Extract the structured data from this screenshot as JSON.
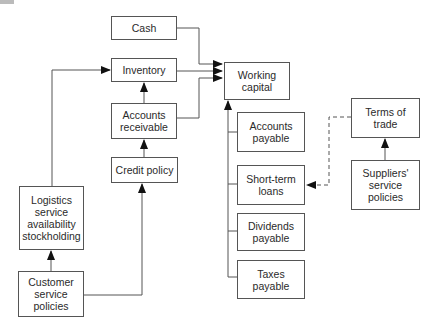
{
  "diagram": {
    "type": "flow",
    "nodes": [
      {
        "id": "cash",
        "label": "Cash",
        "x": 111,
        "y": 16,
        "w": 66,
        "h": 24
      },
      {
        "id": "inventory",
        "label": "Inventory",
        "x": 111,
        "y": 58,
        "w": 66,
        "h": 24
      },
      {
        "id": "accounts_receivable",
        "label": "Accounts\nreceivable",
        "x": 111,
        "y": 103,
        "w": 66,
        "h": 36
      },
      {
        "id": "credit_policy",
        "label": "Credit policy",
        "x": 111,
        "y": 157,
        "w": 67,
        "h": 26
      },
      {
        "id": "working_capital",
        "label": "Working\ncapital",
        "x": 224,
        "y": 62,
        "w": 66,
        "h": 38
      },
      {
        "id": "accounts_payable",
        "label": "Accounts\npayable",
        "x": 237,
        "y": 112,
        "w": 68,
        "h": 40
      },
      {
        "id": "short_term_loans",
        "label": "Short-term\nloans",
        "x": 237,
        "y": 165,
        "w": 68,
        "h": 40
      },
      {
        "id": "dividends_payable",
        "label": "Dividends\npayable",
        "x": 237,
        "y": 213,
        "w": 68,
        "h": 38
      },
      {
        "id": "taxes_payable",
        "label": "Taxes\npayable",
        "x": 237,
        "y": 260,
        "w": 68,
        "h": 39
      },
      {
        "id": "terms_of_trade",
        "label": "Terms of\ntrade",
        "x": 351,
        "y": 98,
        "w": 69,
        "h": 40
      },
      {
        "id": "suppliers_service_policies",
        "label": "Suppliers'\nservice\npolicies",
        "x": 351,
        "y": 160,
        "w": 69,
        "h": 50
      },
      {
        "id": "logistics_service",
        "label": "Logistics\nservice\navailability\nstockholding",
        "x": 19,
        "y": 186,
        "w": 65,
        "h": 64
      },
      {
        "id": "customer_service_policies",
        "label": "Customer\nservice\npolicies",
        "x": 18,
        "y": 271,
        "w": 66,
        "h": 46
      }
    ],
    "edges": [
      {
        "from": "cash",
        "to": "working_capital",
        "style": "solid"
      },
      {
        "from": "inventory",
        "to": "working_capital",
        "style": "solid"
      },
      {
        "from": "accounts_receivable",
        "to": "working_capital",
        "style": "solid"
      },
      {
        "from": "accounts_receivable",
        "to": "inventory",
        "style": "solid"
      },
      {
        "from": "credit_policy",
        "to": "accounts_receivable",
        "style": "solid"
      },
      {
        "from": "logistics_service",
        "to": "inventory",
        "style": "solid"
      },
      {
        "from": "customer_service_policies",
        "to": "logistics_service",
        "style": "solid"
      },
      {
        "from": "customer_service_policies",
        "to": "credit_policy",
        "style": "solid"
      },
      {
        "from": "accounts_payable",
        "to": "working_capital",
        "style": "solid"
      },
      {
        "from": "short_term_loans",
        "to": "working_capital",
        "style": "solid"
      },
      {
        "from": "dividends_payable",
        "to": "working_capital",
        "style": "solid"
      },
      {
        "from": "taxes_payable",
        "to": "working_capital",
        "style": "solid"
      },
      {
        "from": "terms_of_trade",
        "to": "short_term_loans",
        "style": "dashed"
      },
      {
        "from": "suppliers_service_policies",
        "to": "terms_of_trade",
        "style": "solid"
      }
    ],
    "colors": {
      "line": "#555555",
      "border": "#555555",
      "text": "#2a2a2a"
    }
  }
}
